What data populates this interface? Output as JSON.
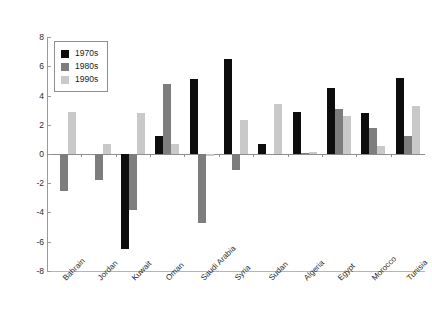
{
  "chart_data": {
    "type": "bar",
    "title": "",
    "xlabel": "",
    "ylabel": "",
    "ylim": [
      -8,
      8
    ],
    "yticks": [
      8,
      6,
      4,
      2,
      0,
      -2,
      -4,
      -6,
      -8
    ],
    "ytick_labels": [
      "8",
      "6",
      "4",
      "2",
      "0",
      "-2",
      "-4",
      "-6",
      "-8"
    ],
    "grid": false,
    "legend_position": "upper-left-inside",
    "categories": [
      "Bahrain",
      "Jordan",
      "Kuwait",
      "Oman",
      "Saudi Arabia",
      "Syria",
      "Sudan",
      "Algeria",
      "Egypt",
      "Morocco",
      "Tunisia"
    ],
    "series": [
      {
        "name": "1970s",
        "color": "#0d0d0d",
        "values": [
          0.0,
          0.0,
          -6.5,
          1.2,
          5.1,
          6.5,
          0.65,
          2.9,
          4.5,
          2.8,
          5.2
        ]
      },
      {
        "name": "1980s",
        "color": "#7d7d7d",
        "values": [
          -2.5,
          -1.8,
          -3.8,
          4.8,
          -4.7,
          -1.1,
          0.0,
          0.1,
          3.05,
          1.75,
          1.2
        ]
      },
      {
        "name": "1990s",
        "color": "#c9c9c9",
        "values": [
          2.9,
          0.7,
          2.8,
          0.65,
          -0.15,
          2.3,
          3.45,
          0.15,
          2.6,
          0.55,
          3.25
        ]
      }
    ]
  },
  "legend": {
    "items": [
      {
        "label": "1970s",
        "color": "#0d0d0d"
      },
      {
        "label": "1980s",
        "color": "#7d7d7d"
      },
      {
        "label": "1990s",
        "color": "#c9c9c9"
      }
    ]
  },
  "cropped_title_text": ""
}
